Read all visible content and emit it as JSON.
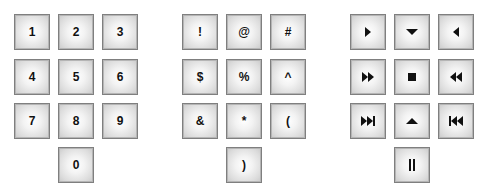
{
  "keypads": {
    "digits": {
      "keys": [
        {
          "label": "1",
          "row": 0,
          "col": 0
        },
        {
          "label": "2",
          "row": 0,
          "col": 1
        },
        {
          "label": "3",
          "row": 0,
          "col": 2
        },
        {
          "label": "4",
          "row": 1,
          "col": 0
        },
        {
          "label": "5",
          "row": 1,
          "col": 1
        },
        {
          "label": "6",
          "row": 1,
          "col": 2
        },
        {
          "label": "7",
          "row": 2,
          "col": 0
        },
        {
          "label": "8",
          "row": 2,
          "col": 1
        },
        {
          "label": "9",
          "row": 2,
          "col": 2
        },
        {
          "label": "0",
          "row": 3,
          "col": 1
        }
      ]
    },
    "symbols": {
      "keys": [
        {
          "label": "!",
          "row": 0,
          "col": 0
        },
        {
          "label": "@",
          "row": 0,
          "col": 1
        },
        {
          "label": "#",
          "row": 0,
          "col": 2
        },
        {
          "label": "$",
          "row": 1,
          "col": 0
        },
        {
          "label": "%",
          "row": 1,
          "col": 1
        },
        {
          "label": "^",
          "row": 1,
          "col": 2
        },
        {
          "label": "&",
          "row": 2,
          "col": 0
        },
        {
          "label": "*",
          "row": 2,
          "col": 1
        },
        {
          "label": "(",
          "row": 2,
          "col": 2
        },
        {
          "label": ")",
          "row": 3,
          "col": 1
        }
      ]
    },
    "media": {
      "keys": [
        {
          "icon": "play-right-icon",
          "row": 0,
          "col": 0
        },
        {
          "icon": "arrow-down-icon",
          "row": 0,
          "col": 1
        },
        {
          "icon": "arrow-left-icon",
          "row": 0,
          "col": 2
        },
        {
          "icon": "fast-forward-icon",
          "row": 1,
          "col": 0
        },
        {
          "icon": "stop-icon",
          "row": 1,
          "col": 1
        },
        {
          "icon": "rewind-icon",
          "row": 1,
          "col": 2
        },
        {
          "icon": "skip-next-icon",
          "row": 2,
          "col": 0
        },
        {
          "icon": "arrow-up-icon",
          "row": 2,
          "col": 1
        },
        {
          "icon": "skip-previous-icon",
          "row": 2,
          "col": 2
        },
        {
          "icon": "pause-icon",
          "row": 3,
          "col": 1
        }
      ]
    }
  },
  "colors": {
    "background": "#ffffff",
    "key_border": "#7f7f7f",
    "key_center": "#ffffff",
    "key_edge": "#c9c9c9",
    "glyph": "#111111"
  }
}
